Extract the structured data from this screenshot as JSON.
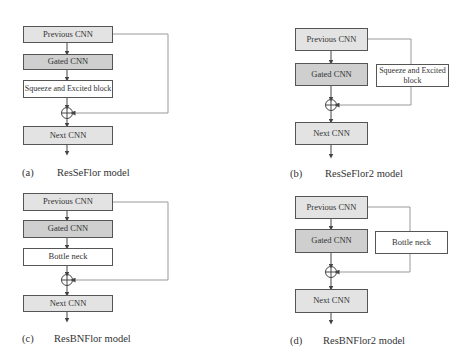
{
  "panels": {
    "a": {
      "label": "(a)",
      "caption": "ResSeFlor model",
      "blocks": [
        "Previous CNN",
        "Gated CNN",
        "Squeeze and Excited block",
        "Next CNN"
      ]
    },
    "b": {
      "label": "(b)",
      "caption": "ResSeFlor2 model",
      "blocks": [
        "Previous CNN",
        "Gated CNN",
        "Squeeze and Excited block",
        "Next CNN"
      ]
    },
    "c": {
      "label": "(c)",
      "caption": "ResBNFlor model",
      "blocks": [
        "Previous CNN",
        "Gated CNN",
        "Bottle neck",
        "Next CNN"
      ]
    },
    "d": {
      "label": "(d)",
      "caption": "ResBNFlor2 model",
      "blocks": [
        "Previous CNN",
        "Gated CNN",
        "Bottle neck",
        "Next CNN"
      ]
    }
  },
  "colors": {
    "box_light": "#e3e3e3",
    "box_dark": "#cfcfcf",
    "line": "#555555",
    "skip_line": "#999999"
  }
}
